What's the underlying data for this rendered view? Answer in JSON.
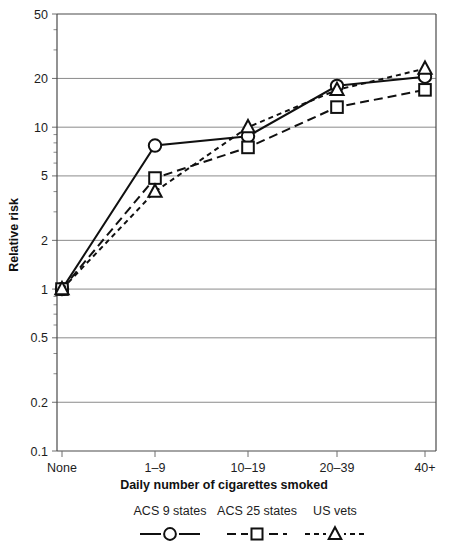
{
  "chart_data": {
    "type": "line",
    "title": "",
    "xlabel": "Daily number of cigarettes smoked",
    "ylabel": "Relative risk",
    "categories": [
      "None",
      "1–9",
      "10–19",
      "20–39",
      "40+"
    ],
    "yscale": "log",
    "ylim": [
      0.1,
      50
    ],
    "yticks": [
      50,
      20,
      10,
      5,
      2,
      1,
      0.5,
      0.2,
      0.1
    ],
    "ytick_labels": [
      "50",
      "20",
      "10",
      "5",
      "2",
      "1",
      "0.5",
      "0.2",
      "0.1"
    ],
    "grid": true,
    "legend_position": "bottom",
    "series": [
      {
        "name": "ACS 9 states",
        "marker": "circle",
        "linestyle": "solid",
        "values": [
          1.0,
          7.7,
          8.8,
          18.0,
          20.5
        ]
      },
      {
        "name": "ACS 25 states",
        "marker": "square",
        "linestyle": "dashed",
        "values": [
          1.0,
          4.85,
          7.5,
          13.3,
          17.0
        ]
      },
      {
        "name": "US vets",
        "marker": "triangle",
        "linestyle": "dotted-dash",
        "values": [
          1.0,
          4.0,
          10.0,
          17.0,
          23.0
        ]
      }
    ]
  },
  "axes": {
    "y_title": "Relative risk",
    "x_title": "Daily number of cigarettes smoked",
    "y_tick_labels": [
      "50",
      "20",
      "10",
      "5",
      "2",
      "1",
      "0.5",
      "0.2",
      "0.1"
    ],
    "x_tick_labels": [
      "None",
      "1–9",
      "10–19",
      "20–39",
      "40+"
    ]
  },
  "legend": {
    "items": [
      {
        "label": "ACS 9 states",
        "marker": "circle-marker",
        "style": "solid"
      },
      {
        "label": "ACS 25 states",
        "marker": "square-marker",
        "style": "dashed"
      },
      {
        "label": "US vets",
        "marker": "triangle-marker",
        "style": "dotted"
      }
    ]
  },
  "colors": {
    "ink": "#101010",
    "grid": "#8b8b8b",
    "axis": "#4a4a4a",
    "background": "#ffffff"
  }
}
